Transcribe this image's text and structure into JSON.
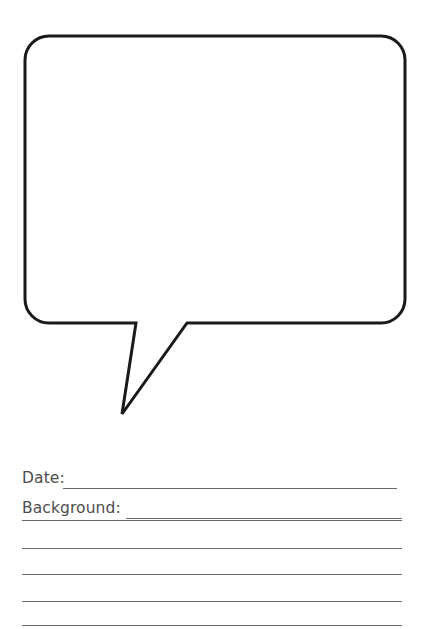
{
  "page": {
    "background_color": "#ffffff",
    "width": 424,
    "height": 629
  },
  "bubble": {
    "name": "speech-bubble",
    "description": "Empty rounded rectangle speech balloon with a pointed tail at lower left",
    "stroke_color": "#1a1a1a",
    "fill_color": "#ffffff",
    "stroke_width": 3,
    "corner_radius": 24,
    "box": {
      "left": 25,
      "top": 36,
      "right": 405,
      "bottom": 323
    },
    "tail": {
      "left_join_x": 136,
      "right_join_x": 187,
      "tip_x": 122,
      "tip_y": 414
    },
    "content_text": ""
  },
  "form": {
    "fields": [
      {
        "label": "Date:",
        "value": "",
        "placeholder": "",
        "rule_start_x": 63,
        "rule_end_x": 397,
        "top": 38
      },
      {
        "label": "Background:",
        "value": "",
        "placeholder": "",
        "rule_start_x": 126,
        "rule_end_x": 402,
        "top": 68
      }
    ],
    "ruled_lines": [
      {
        "y": 520
      },
      {
        "y": 548
      },
      {
        "y": 574
      },
      {
        "y": 601
      },
      {
        "y": 625
      }
    ],
    "rule_color": "#6a6a6a",
    "label_color": "#4d4d4d"
  }
}
